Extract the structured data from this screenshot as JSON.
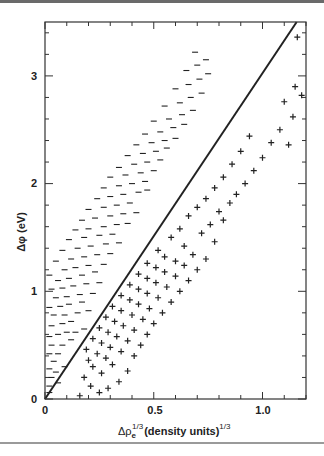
{
  "chart_data": {
    "type": "scatter",
    "title": "",
    "xlabel": "Δρe^(1/3) (density units)^(1/3)",
    "ylabel": "Δφ (eV)",
    "xlim": [
      0,
      1.2
    ],
    "ylim": [
      0,
      3.5
    ],
    "x_ticks_major": [
      0,
      0.5,
      1.0
    ],
    "x_tick_labels": [
      "0",
      "0.5",
      "1.0"
    ],
    "x_ticks_minor_step": 0.1,
    "y_ticks_major": [
      0,
      1,
      2,
      3
    ],
    "y_tick_labels": [
      "0",
      "1",
      "2",
      "3"
    ],
    "y_ticks_minor_step": 0.2,
    "grid": false,
    "legend": null,
    "fit_line": {
      "x": [
        0,
        1.157
      ],
      "y": [
        0,
        3.5
      ],
      "slope": 3.02,
      "intercept": 0
    },
    "marker_note": "Markers are a sampled approximation of the visible distribution, not individually transcribed coordinates. The figure has several hundred overlapping marks too dense to read point-by-point; axes, ticks, labels and fit line are measured.",
    "series": [
      {
        "name": "minus",
        "marker": "−",
        "values_approximate": true,
        "points": [
          [
            0.02,
            0.06
          ],
          [
            0.02,
            0.12
          ],
          [
            0.03,
            0.2
          ],
          [
            0.02,
            0.28
          ],
          [
            0.05,
            0.25
          ],
          [
            0.04,
            0.35
          ],
          [
            0.06,
            0.15
          ],
          [
            0.02,
            0.42
          ],
          [
            0.06,
            0.42
          ],
          [
            0.09,
            0.3
          ],
          [
            0.03,
            0.5
          ],
          [
            0.08,
            0.5
          ],
          [
            0.12,
            0.55
          ],
          [
            0.02,
            0.58
          ],
          [
            0.06,
            0.6
          ],
          [
            0.1,
            0.62
          ],
          [
            0.14,
            0.62
          ],
          [
            0.18,
            0.65
          ],
          [
            0.03,
            0.68
          ],
          [
            0.08,
            0.7
          ],
          [
            0.12,
            0.72
          ],
          [
            0.04,
            0.78
          ],
          [
            0.09,
            0.78
          ],
          [
            0.15,
            0.8
          ],
          [
            0.2,
            0.82
          ],
          [
            0.02,
            0.85
          ],
          [
            0.07,
            0.86
          ],
          [
            0.11,
            0.88
          ],
          [
            0.17,
            0.9
          ],
          [
            0.05,
            0.94
          ],
          [
            0.1,
            0.95
          ],
          [
            0.16,
            0.97
          ],
          [
            0.22,
            0.98
          ],
          [
            0.03,
            1.02
          ],
          [
            0.08,
            1.03
          ],
          [
            0.13,
            1.05
          ],
          [
            0.19,
            1.07
          ],
          [
            0.25,
            1.08
          ],
          [
            0.06,
            1.1
          ],
          [
            0.11,
            1.12
          ],
          [
            0.02,
            1.15
          ],
          [
            0.17,
            1.15
          ],
          [
            0.23,
            1.18
          ],
          [
            0.09,
            1.2
          ],
          [
            0.14,
            1.22
          ],
          [
            0.2,
            1.24
          ],
          [
            0.27,
            1.25
          ],
          [
            0.05,
            1.28
          ],
          [
            0.12,
            1.3
          ],
          [
            0.18,
            1.32
          ],
          [
            0.24,
            1.34
          ],
          [
            0.3,
            1.35
          ],
          [
            0.08,
            1.38
          ],
          [
            0.15,
            1.4
          ],
          [
            0.21,
            1.42
          ],
          [
            0.28,
            1.44
          ],
          [
            0.34,
            1.45
          ],
          [
            0.11,
            1.48
          ],
          [
            0.18,
            1.5
          ],
          [
            0.25,
            1.52
          ],
          [
            0.31,
            1.53
          ],
          [
            0.14,
            1.57
          ],
          [
            0.2,
            1.58
          ],
          [
            0.27,
            1.6
          ],
          [
            0.33,
            1.62
          ],
          [
            0.38,
            1.63
          ],
          [
            0.17,
            1.66
          ],
          [
            0.23,
            1.68
          ],
          [
            0.3,
            1.7
          ],
          [
            0.36,
            1.72
          ],
          [
            0.42,
            1.73
          ],
          [
            0.2,
            1.76
          ],
          [
            0.27,
            1.78
          ],
          [
            0.33,
            1.8
          ],
          [
            0.39,
            1.82
          ],
          [
            0.24,
            1.86
          ],
          [
            0.3,
            1.88
          ],
          [
            0.36,
            1.9
          ],
          [
            0.43,
            1.92
          ],
          [
            0.47,
            1.94
          ],
          [
            0.27,
            1.96
          ],
          [
            0.34,
            1.98
          ],
          [
            0.4,
            2.0
          ],
          [
            0.46,
            2.02
          ],
          [
            0.3,
            2.06
          ],
          [
            0.37,
            2.08
          ],
          [
            0.44,
            2.1
          ],
          [
            0.5,
            2.12
          ],
          [
            0.34,
            2.15
          ],
          [
            0.41,
            2.18
          ],
          [
            0.47,
            2.2
          ],
          [
            0.53,
            2.22
          ],
          [
            0.38,
            2.26
          ],
          [
            0.45,
            2.28
          ],
          [
            0.51,
            2.3
          ],
          [
            0.56,
            2.33
          ],
          [
            0.42,
            2.36
          ],
          [
            0.49,
            2.38
          ],
          [
            0.55,
            2.4
          ],
          [
            0.6,
            2.42
          ],
          [
            0.46,
            2.46
          ],
          [
            0.53,
            2.48
          ],
          [
            0.59,
            2.52
          ],
          [
            0.64,
            2.55
          ],
          [
            0.5,
            2.58
          ],
          [
            0.57,
            2.6
          ],
          [
            0.63,
            2.64
          ],
          [
            0.68,
            2.68
          ],
          [
            0.55,
            2.72
          ],
          [
            0.62,
            2.75
          ],
          [
            0.67,
            2.8
          ],
          [
            0.72,
            2.84
          ],
          [
            0.6,
            2.88
          ],
          [
            0.66,
            2.92
          ],
          [
            0.71,
            2.97
          ],
          [
            0.75,
            3.02
          ],
          [
            0.65,
            3.05
          ],
          [
            0.7,
            3.1
          ],
          [
            0.74,
            3.15
          ],
          [
            0.69,
            3.22
          ]
        ]
      },
      {
        "name": "plus",
        "marker": "+",
        "values_approximate": true,
        "points": [
          [
            0.16,
            0.03
          ],
          [
            0.25,
            0.06
          ],
          [
            0.29,
            0.1
          ],
          [
            0.21,
            0.12
          ],
          [
            0.34,
            0.16
          ],
          [
            0.18,
            0.2
          ],
          [
            0.26,
            0.24
          ],
          [
            0.38,
            0.26
          ],
          [
            0.22,
            0.3
          ],
          [
            0.31,
            0.32
          ],
          [
            0.2,
            0.36
          ],
          [
            0.28,
            0.38
          ],
          [
            0.41,
            0.4
          ],
          [
            0.24,
            0.42
          ],
          [
            0.35,
            0.44
          ],
          [
            0.19,
            0.46
          ],
          [
            0.3,
            0.48
          ],
          [
            0.44,
            0.5
          ],
          [
            0.26,
            0.52
          ],
          [
            0.38,
            0.54
          ],
          [
            0.22,
            0.56
          ],
          [
            0.33,
            0.58
          ],
          [
            0.47,
            0.6
          ],
          [
            0.29,
            0.62
          ],
          [
            0.41,
            0.64
          ],
          [
            0.25,
            0.66
          ],
          [
            0.36,
            0.68
          ],
          [
            0.5,
            0.7
          ],
          [
            0.32,
            0.72
          ],
          [
            0.45,
            0.74
          ],
          [
            0.28,
            0.76
          ],
          [
            0.4,
            0.78
          ],
          [
            0.54,
            0.8
          ],
          [
            0.35,
            0.82
          ],
          [
            0.48,
            0.84
          ],
          [
            0.31,
            0.86
          ],
          [
            0.43,
            0.88
          ],
          [
            0.58,
            0.9
          ],
          [
            0.39,
            0.92
          ],
          [
            0.52,
            0.94
          ],
          [
            0.35,
            0.96
          ],
          [
            0.47,
            0.98
          ],
          [
            0.62,
            1.0
          ],
          [
            0.43,
            1.02
          ],
          [
            0.56,
            1.04
          ],
          [
            0.39,
            1.06
          ],
          [
            0.51,
            1.08
          ],
          [
            0.66,
            1.1
          ],
          [
            0.47,
            1.12
          ],
          [
            0.6,
            1.14
          ],
          [
            0.43,
            1.16
          ],
          [
            0.55,
            1.18
          ],
          [
            0.7,
            1.2
          ],
          [
            0.51,
            1.22
          ],
          [
            0.64,
            1.24
          ],
          [
            0.47,
            1.26
          ],
          [
            0.6,
            1.28
          ],
          [
            0.74,
            1.3
          ],
          [
            0.55,
            1.32
          ],
          [
            0.68,
            1.34
          ],
          [
            0.52,
            1.38
          ],
          [
            0.64,
            1.42
          ],
          [
            0.78,
            1.46
          ],
          [
            0.58,
            1.5
          ],
          [
            0.72,
            1.54
          ],
          [
            0.62,
            1.58
          ],
          [
            0.76,
            1.62
          ],
          [
            0.82,
            1.66
          ],
          [
            0.66,
            1.7
          ],
          [
            0.8,
            1.74
          ],
          [
            0.7,
            1.78
          ],
          [
            0.85,
            1.82
          ],
          [
            0.74,
            1.86
          ],
          [
            0.88,
            1.9
          ],
          [
            0.78,
            1.96
          ],
          [
            0.92,
            2.0
          ],
          [
            0.82,
            2.06
          ],
          [
            0.96,
            2.12
          ],
          [
            0.86,
            2.18
          ],
          [
            1.0,
            2.24
          ],
          [
            0.9,
            2.3
          ],
          [
            1.04,
            2.38
          ],
          [
            0.94,
            2.44
          ],
          [
            1.08,
            2.5
          ],
          [
            1.12,
            2.36
          ],
          [
            1.14,
            2.62
          ],
          [
            1.1,
            2.76
          ],
          [
            1.15,
            2.9
          ],
          [
            1.18,
            2.82
          ],
          [
            1.16,
            3.36
          ]
        ]
      }
    ]
  },
  "labels": {
    "x_tick_0": "0",
    "x_tick_05": "0.5",
    "x_tick_10": "1.0",
    "y_tick_0": "0",
    "y_tick_1": "1",
    "y_tick_2": "2",
    "y_tick_3": "3",
    "xlabel_main": "Δρ",
    "xlabel_sub": "e",
    "xlabel_sup": "1/3",
    "xlabel_rest": "(density units)",
    "xlabel_sup2": "1/3",
    "ylabel": "Δφ (eV)"
  },
  "colors": {
    "ink": "#222222",
    "frame": "#333333",
    "background": "#ffffff"
  }
}
